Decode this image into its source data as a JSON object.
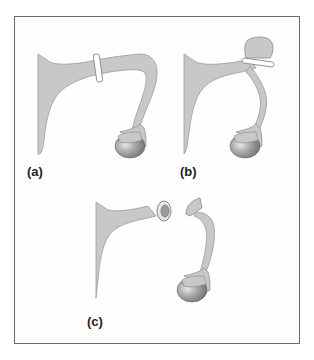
{
  "figure": {
    "panels": [
      {
        "id": "a",
        "label": "(a)",
        "description": "Arm with band around upper region, hand resting on ball"
      },
      {
        "id": "b",
        "label": "(b)",
        "description": "Arm bent with band tied around a pinched bulb"
      },
      {
        "id": "c",
        "label": "(c)",
        "description": "Arm detached: stump with ring on left, hand holding ball on right"
      }
    ],
    "colors": {
      "body_fill": "#c8c8c8",
      "body_stroke": "#9a9a9a",
      "ball_fill": "#8f8f8f",
      "ball_highlight": "#d9d9d9",
      "band_fill": "#ffffff",
      "frame_border": "#6a6a6a",
      "label_color": "#222222"
    }
  }
}
